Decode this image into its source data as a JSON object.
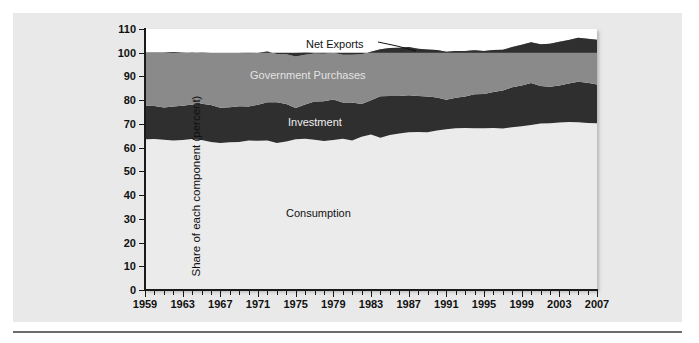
{
  "figure": {
    "background_color": "#e9e9e9",
    "plot_background_color": "#ffffff",
    "rule_color": "#6b6b6b"
  },
  "chart_data": {
    "type": "area",
    "stacked": true,
    "title": "",
    "subtitle": "",
    "xlabel": "",
    "ylabel": "Share of each component (percent)",
    "ylim": [
      0,
      110
    ],
    "xlim": [
      1959,
      2007
    ],
    "ytick_labels": [
      "0",
      "10",
      "20",
      "30",
      "40",
      "50",
      "60",
      "70",
      "80",
      "90",
      "100",
      "110"
    ],
    "ytick_values": [
      0,
      10,
      20,
      30,
      40,
      50,
      60,
      70,
      80,
      90,
      100,
      110
    ],
    "xtick_labels": [
      "1959",
      "1963",
      "1967",
      "1971",
      "1975",
      "1979",
      "1983",
      "1987",
      "1991",
      "1995",
      "1999",
      "2003",
      "2007"
    ],
    "xtick_values": [
      1959,
      1963,
      1967,
      1971,
      1975,
      1979,
      1983,
      1987,
      1991,
      1995,
      1999,
      2003,
      2007
    ],
    "minor_xtick_interval": 1,
    "grid": false,
    "legend": "inline-labels",
    "annotations": [
      {
        "name": "net-exports-leader",
        "text": "Net Exports",
        "points_to": "dark band above 100 percent"
      }
    ],
    "x": [
      1959,
      1960,
      1961,
      1962,
      1963,
      1964,
      1965,
      1966,
      1967,
      1968,
      1969,
      1970,
      1971,
      1972,
      1973,
      1974,
      1975,
      1976,
      1977,
      1978,
      1979,
      1980,
      1981,
      1982,
      1983,
      1984,
      1985,
      1986,
      1987,
      1988,
      1989,
      1990,
      1991,
      1992,
      1993,
      1994,
      1995,
      1996,
      1997,
      1998,
      1999,
      2000,
      2001,
      2002,
      2003,
      2004,
      2005,
      2006,
      2007
    ],
    "series": [
      {
        "name": "Consumption",
        "color": "#ebebeb",
        "label_color": "#111111",
        "values": [
          63.5,
          63.6,
          63.3,
          63.0,
          63.2,
          63.6,
          63.2,
          62.4,
          62.0,
          62.3,
          62.4,
          63.0,
          62.9,
          63.0,
          62.0,
          62.6,
          63.5,
          63.7,
          63.3,
          62.8,
          63.2,
          63.7,
          63.0,
          64.6,
          65.5,
          64.2,
          65.3,
          66.0,
          66.5,
          66.6,
          66.5,
          67.2,
          67.8,
          68.2,
          68.3,
          68.2,
          68.2,
          68.3,
          68.1,
          68.6,
          69.0,
          69.5,
          70.2,
          70.3,
          70.6,
          70.8,
          70.7,
          70.4,
          70.3
        ]
      },
      {
        "name": "Investment",
        "color": "#2f2f2f",
        "label_color": "#efefef",
        "values": [
          14.3,
          13.9,
          13.6,
          14.3,
          14.5,
          14.6,
          15.3,
          15.6,
          14.8,
          14.7,
          15.0,
          14.3,
          15.2,
          16.1,
          17.1,
          15.8,
          13.2,
          14.5,
          16.1,
          16.8,
          17.1,
          15.3,
          16.0,
          13.8,
          14.5,
          17.5,
          16.5,
          15.8,
          15.6,
          15.2,
          15.0,
          13.9,
          12.4,
          12.8,
          13.3,
          14.3,
          14.4,
          15.2,
          16.0,
          16.8,
          17.2,
          17.7,
          15.8,
          15.4,
          15.6,
          16.2,
          17.1,
          16.9,
          16.3
        ]
      },
      {
        "name": "Government Purchases",
        "color": "#8a8a8a",
        "label_color": "#e3e3e3",
        "values": [
          22.3,
          22.6,
          23.2,
          23.0,
          22.4,
          21.9,
          21.6,
          22.0,
          23.2,
          23.0,
          22.6,
          22.4,
          21.9,
          21.4,
          20.4,
          21.0,
          21.7,
          20.9,
          20.3,
          20.0,
          19.7,
          20.2,
          20.2,
          21.0,
          20.4,
          19.8,
          20.2,
          20.3,
          20.3,
          19.9,
          19.9,
          20.1,
          20.2,
          19.7,
          19.1,
          18.5,
          18.1,
          17.6,
          17.2,
          17.0,
          17.2,
          17.2,
          17.6,
          18.1,
          18.4,
          18.4,
          18.5,
          18.6,
          18.9
        ]
      },
      {
        "name": "Net Exports",
        "color": "#2f2f2f",
        "label_color": "#111111",
        "values": [
          -0.1,
          -0.1,
          -0.1,
          -0.3,
          -0.1,
          0.1,
          -0.1,
          0.0,
          0.0,
          0.0,
          0.0,
          0.3,
          0.0,
          -0.5,
          0.5,
          0.6,
          1.6,
          1.0,
          0.3,
          0.4,
          0.0,
          0.8,
          0.8,
          0.6,
          -0.4,
          -1.5,
          -2.0,
          -2.1,
          -2.4,
          -1.7,
          -1.4,
          -1.2,
          -0.4,
          -0.7,
          -0.7,
          -1.0,
          -0.7,
          -1.1,
          -1.3,
          -2.4,
          -3.4,
          -4.4,
          -3.6,
          -3.8,
          -4.6,
          -5.4,
          -6.3,
          -5.9,
          -5.5
        ]
      }
    ]
  },
  "labels": {
    "y_axis_title": "Share of each component (percent)",
    "net_exports": "Net Exports",
    "government_purchases": "Government Purchases",
    "investment": "Investment",
    "consumption": "Consumption"
  }
}
